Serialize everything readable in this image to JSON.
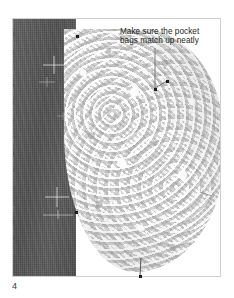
{
  "figure": {
    "number": "4",
    "annotation": {
      "line1": "Make sure the pocket",
      "line2": "bags match up neatly"
    },
    "parts": {
      "denim_panel_label": "dark denim fabric panel",
      "pocket_bag_label": "light mottled pocket bag fabric",
      "tailor_marks_label": "chalk tailor tack marks"
    },
    "colors": {
      "denim": "#565656",
      "pocket_bag": "#e2e2e2",
      "leader_line": "#6f6f6f",
      "marker_dot": "#1c1c1c",
      "frame_border": "#cfcfcf",
      "text": "#231f20",
      "background": "#ffffff"
    }
  }
}
